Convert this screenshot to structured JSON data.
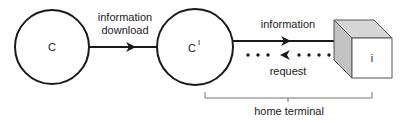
{
  "diagram": {
    "nodes": {
      "c": {
        "label": "C"
      },
      "c_prime": {
        "label": "C",
        "superscript": "I"
      },
      "terminal_cube": {
        "label": "i"
      }
    },
    "edges": {
      "download": {
        "label_line1": "information",
        "label_line2": "download",
        "style": "solid",
        "direction": "right"
      },
      "information": {
        "label": "information",
        "style": "solid",
        "direction": "right"
      },
      "request": {
        "label": "request",
        "style": "dotted",
        "direction": "left"
      }
    },
    "bracket": {
      "label": "home terminal"
    },
    "colors": {
      "stroke": "#1a1a1a",
      "cube_side": "#c8c8c8",
      "cube_front": "#ffffff",
      "bracket": "#777777"
    }
  }
}
